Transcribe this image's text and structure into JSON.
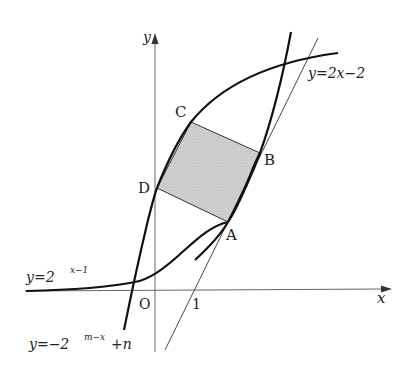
{
  "figure": {
    "type": "coordinate-graph",
    "axes": {
      "x_label": "x",
      "y_label": "y",
      "origin_label": "O",
      "tick_label_1": "1"
    },
    "curves": [
      {
        "id": "exp-curve",
        "label_lhs": "y=2",
        "label_exp": "x−1",
        "equation": "y=2^(x-1)"
      },
      {
        "id": "neg-exp-curve",
        "label_lhs": "y=−2",
        "label_exp": "m−x",
        "label_rhs": "+n",
        "equation": "y=-2^(m-x)+n"
      },
      {
        "id": "line",
        "label": "y=2x−2",
        "equation": "y=2x-2"
      }
    ],
    "points": [
      {
        "name": "A"
      },
      {
        "name": "B"
      },
      {
        "name": "C"
      },
      {
        "name": "D"
      }
    ],
    "shaded_region": "square ABCD",
    "colors": {
      "curve": "#111111",
      "axis": "#555555",
      "shade": "#c8c8c8",
      "square_edge": "#333333"
    }
  }
}
